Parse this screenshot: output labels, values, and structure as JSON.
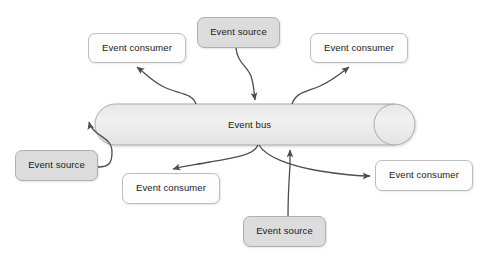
{
  "diagram": {
    "canvas": {
      "width": 482,
      "height": 268,
      "background": "#ffffff"
    },
    "colors": {
      "source_fill": "#dcdcdc",
      "consumer_fill": "#fdfdfd",
      "bus_fill": "#ededed",
      "node_stroke": "#b5b5b5",
      "edge_stroke": "#4d4d4d",
      "text": "#1a1a1a"
    },
    "bus": {
      "label": "Event bus",
      "shape": "cylinder",
      "x": 95,
      "y": 104,
      "width": 320,
      "height": 41
    },
    "nodes": [
      {
        "id": "consumer-top-left",
        "kind": "consumer",
        "label": "Event consumer",
        "x": 88,
        "y": 33,
        "width": 98,
        "height": 30
      },
      {
        "id": "source-top-center",
        "kind": "source",
        "label": "Event source",
        "x": 197,
        "y": 17,
        "width": 83,
        "height": 31
      },
      {
        "id": "consumer-top-right",
        "kind": "consumer",
        "label": "Event consumer",
        "x": 310,
        "y": 33,
        "width": 98,
        "height": 30
      },
      {
        "id": "source-left",
        "kind": "source",
        "label": "Event source",
        "x": 15,
        "y": 150,
        "width": 83,
        "height": 31
      },
      {
        "id": "consumer-bottom-mid",
        "kind": "consumer",
        "label": "Event consumer",
        "x": 122,
        "y": 173,
        "width": 98,
        "height": 31
      },
      {
        "id": "consumer-right",
        "kind": "consumer",
        "label": "Event consumer",
        "x": 375,
        "y": 160,
        "width": 98,
        "height": 31
      },
      {
        "id": "source-bottom",
        "kind": "source",
        "label": "Event source",
        "x": 243,
        "y": 216,
        "width": 83,
        "height": 31
      }
    ],
    "edges": [
      {
        "id": "edge-bus-to-consumer-top-left",
        "from": "bus",
        "to": "consumer-top-left",
        "direction": "out"
      },
      {
        "id": "edge-source-top-center-to-bus",
        "from": "source-top-center",
        "to": "bus",
        "direction": "in"
      },
      {
        "id": "edge-bus-to-consumer-top-right",
        "from": "bus",
        "to": "consumer-top-right",
        "direction": "out"
      },
      {
        "id": "edge-source-left-to-bus",
        "from": "source-left",
        "to": "bus",
        "direction": "in"
      },
      {
        "id": "edge-bus-to-consumer-bottom-mid",
        "from": "bus",
        "to": "consumer-bottom-mid",
        "direction": "out"
      },
      {
        "id": "edge-bus-to-consumer-right",
        "from": "bus",
        "to": "consumer-right",
        "direction": "out"
      },
      {
        "id": "edge-source-bottom-to-bus",
        "from": "source-bottom",
        "to": "bus",
        "direction": "in"
      }
    ]
  }
}
